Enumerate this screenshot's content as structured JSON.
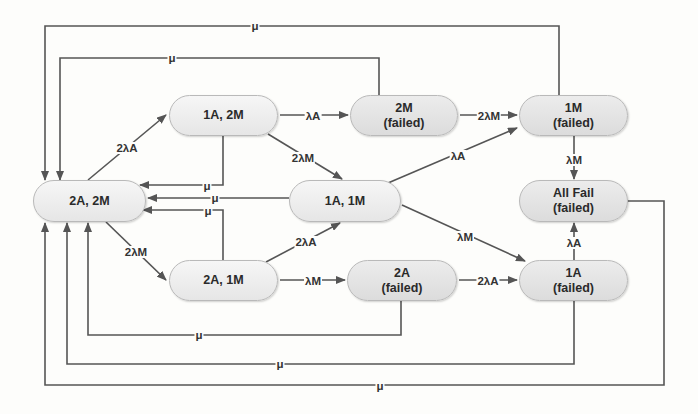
{
  "diagram": {
    "type": "markov-state-transition",
    "nodes": [
      {
        "id": "s22",
        "line1": "2A, 2M",
        "line2": "",
        "failed": false
      },
      {
        "id": "s12",
        "line1": "1A, 2M",
        "line2": "",
        "failed": false
      },
      {
        "id": "s21",
        "line1": "2A, 1M",
        "line2": "",
        "failed": false
      },
      {
        "id": "s11",
        "line1": "1A, 1M",
        "line2": "",
        "failed": false
      },
      {
        "id": "f2M",
        "line1": "2M",
        "line2": "(failed)",
        "failed": true
      },
      {
        "id": "f1M",
        "line1": "1M",
        "line2": "(failed)",
        "failed": true
      },
      {
        "id": "fAll",
        "line1": "All Fail",
        "line2": "(failed)",
        "failed": true
      },
      {
        "id": "f2A",
        "line1": "2A",
        "line2": "(failed)",
        "failed": true
      },
      {
        "id": "f1A",
        "line1": "1A",
        "line2": "(failed)",
        "failed": true
      }
    ],
    "edges": [
      {
        "from": "2A, 2M",
        "to": "1A, 2M",
        "label": "2λA"
      },
      {
        "from": "2A, 2M",
        "to": "2A, 1M",
        "label": "2λM"
      },
      {
        "from": "1A, 2M",
        "to": "2M (failed)",
        "label": "λA"
      },
      {
        "from": "1A, 2M",
        "to": "1A, 1M",
        "label": "2λM"
      },
      {
        "from": "2M (failed)",
        "to": "1M (failed)",
        "label": "2λM"
      },
      {
        "from": "1A, 1M",
        "to": "1M (failed)",
        "label": "λA"
      },
      {
        "from": "1A, 1M",
        "to": "1A (failed)",
        "label": "λM"
      },
      {
        "from": "2A, 1M",
        "to": "1A, 1M",
        "label": "2λA"
      },
      {
        "from": "2A, 1M",
        "to": "2A (failed)",
        "label": "λM"
      },
      {
        "from": "2A (failed)",
        "to": "1A (failed)",
        "label": "2λA"
      },
      {
        "from": "1M (failed)",
        "to": "All Fail (failed)",
        "label": "λM"
      },
      {
        "from": "1A (failed)",
        "to": "All Fail (failed)",
        "label": "λA"
      },
      {
        "from": "1A, 2M",
        "to": "2A, 2M",
        "label": "μ"
      },
      {
        "from": "1A, 1M",
        "to": "2A, 2M",
        "label": "μ"
      },
      {
        "from": "2A, 1M",
        "to": "2A, 2M",
        "label": "μ"
      },
      {
        "from": "2M (failed)",
        "to": "2A, 2M",
        "label": "μ"
      },
      {
        "from": "1M (failed)",
        "to": "2A, 2M",
        "label": "μ"
      },
      {
        "from": "2A (failed)",
        "to": "2A, 2M",
        "label": "μ"
      },
      {
        "from": "1A (failed)",
        "to": "2A, 2M",
        "label": "μ"
      },
      {
        "from": "All Fail (failed)",
        "to": "2A, 2M",
        "label": "μ"
      }
    ]
  },
  "labels": {
    "mu": "μ",
    "lA": "λA",
    "lM": "λM",
    "l2A": "2λA",
    "l2M": "2λM"
  },
  "colors": {
    "line": "#555555",
    "node_fill": "#eeeeee",
    "failed_fill": "#e2e2e2",
    "node_border": "#b9b9b9"
  }
}
